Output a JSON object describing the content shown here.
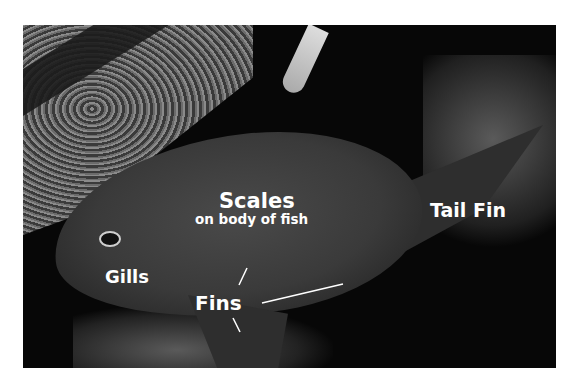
{
  "image": {
    "description": "Grayscale photograph of a fish swimming over coral reef with anatomical labels",
    "labels": {
      "scales_title": "Scales",
      "scales_subtitle": "on body of fish",
      "tail_fin": "Tail Fin",
      "gills": "Gills",
      "fins": "Fins"
    }
  }
}
